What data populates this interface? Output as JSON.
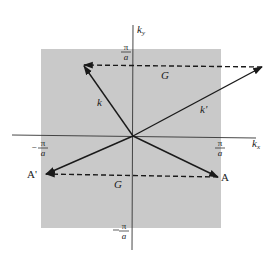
{
  "diagram": {
    "colors": {
      "zone": "#c9c9c9",
      "line": "#1a1a1a",
      "background": "#ffffff"
    },
    "axes": {
      "x_label": "k",
      "x_sub": "x",
      "y_label": "k",
      "y_sub": "y"
    },
    "ticks": {
      "pi": "π",
      "a": "a",
      "minus": "−"
    },
    "vectors": {
      "k": "k",
      "k_prime": "k'",
      "G_top": "G",
      "G_bottom": "G"
    },
    "points": {
      "A": "A",
      "A_prime": "A'"
    }
  }
}
